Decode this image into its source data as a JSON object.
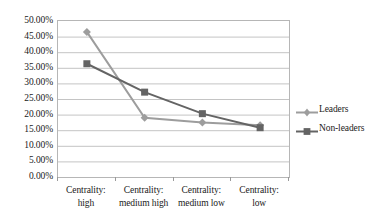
{
  "chart_data": {
    "type": "line",
    "title": "",
    "xlabel": "",
    "ylabel": "",
    "ylim": [
      0,
      0.5
    ],
    "grid": true,
    "legend_position": "right",
    "categories": [
      "Centrality: high",
      "Centrality: medium high",
      "Centrality: medium low",
      "Centrality: low"
    ],
    "category_lines": [
      [
        "Centrality:",
        "high"
      ],
      [
        "Centrality:",
        "medium high"
      ],
      [
        "Centrality:",
        "medium low"
      ],
      [
        "Centrality:",
        "low"
      ]
    ],
    "ytick_labels": [
      "50.00%",
      "45.00%",
      "40.00%",
      "35.00%",
      "30.00%",
      "25.00%",
      "20.00%",
      "15.00%",
      "10.00%",
      "5.00%",
      "0.00%"
    ],
    "ytick_values": [
      50,
      45,
      40,
      35,
      30,
      25,
      20,
      15,
      10,
      5,
      0
    ],
    "series": [
      {
        "name": "Leaders",
        "marker": "diamond",
        "color": "#9d9d9d",
        "values": [
          46.5,
          19.0,
          17.5,
          16.6
        ]
      },
      {
        "name": "Non-leaders",
        "marker": "square",
        "color": "#646464",
        "values": [
          36.3,
          27.2,
          20.3,
          15.8
        ]
      }
    ]
  },
  "legend": {
    "items": [
      {
        "label": "Leaders"
      },
      {
        "label": "Non-leaders"
      }
    ]
  },
  "colors": {
    "leaders": "#9d9d9d",
    "non_leaders": "#646464",
    "gridline": "#c4c4c4",
    "axis_border": "#b6b6b6",
    "text": "#1a1a1a",
    "background": "#ffffff"
  }
}
